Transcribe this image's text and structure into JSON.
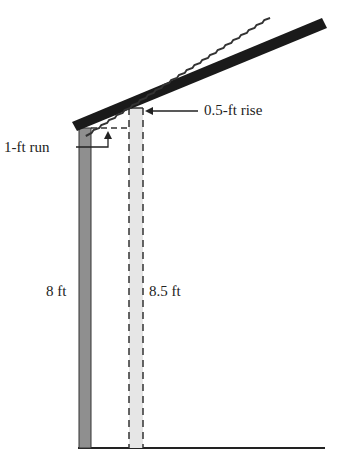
{
  "diagram": {
    "labels": {
      "rise": "0.5-ft rise",
      "run": "1-ft run",
      "short_post": "8 ft",
      "tall_post": "8.5 ft"
    },
    "colors": {
      "roof": "#1a1a1a",
      "short_post_fill": "#8f8f8f",
      "tall_post_fill": "#e4e4e4",
      "ground": "#222222",
      "lines": "#222222"
    }
  }
}
